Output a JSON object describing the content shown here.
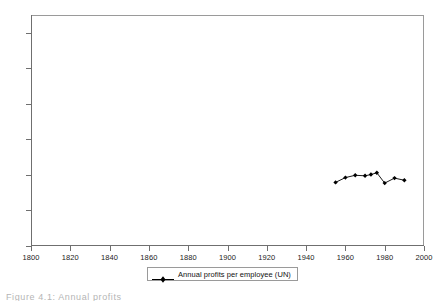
{
  "chart_data": {
    "type": "line",
    "title": "",
    "subtitle": "",
    "xlabel": "",
    "ylabel": "",
    "xlim": [
      1800,
      2000
    ],
    "ylim": [
      0,
      130
    ],
    "xticks": [
      1800,
      1820,
      1840,
      1860,
      1880,
      1900,
      1920,
      1940,
      1960,
      1980,
      2000
    ],
    "yticks": [
      0,
      20,
      40,
      60,
      80,
      100,
      120
    ],
    "xtick_labels": [
      "1800",
      "1820",
      "1840",
      "1860",
      "1880",
      "1900",
      "1920",
      "1940",
      "1960",
      "1980",
      "2000"
    ],
    "ytick_labels": [
      "0",
      "20",
      "40",
      "60",
      "80",
      "100",
      "120"
    ],
    "grid": false,
    "legend_position": "bottom-center",
    "series": [
      {
        "name": "Annual profits per employee (UN)",
        "color": "#000000",
        "marker": "diamond",
        "x": [
          1955,
          1960,
          1965,
          1970,
          1973,
          1976,
          1980,
          1985,
          1990
        ],
        "values": [
          35.8,
          38.5,
          39.8,
          39.5,
          40.2,
          41.2,
          35.4,
          38.2,
          37.0
        ]
      }
    ],
    "legend": [
      {
        "label": "Annual profits per employee (UN)",
        "color": "#000000",
        "marker": "diamond"
      }
    ],
    "annotations": []
  },
  "caption": {
    "fragment": "Figure 4.1:  Annual profits"
  },
  "colors": {
    "axis": "#6f6f6f",
    "frame": "#9a9a9a",
    "series": "#000000",
    "text": "#1b1b1b",
    "background": "#ffffff"
  }
}
